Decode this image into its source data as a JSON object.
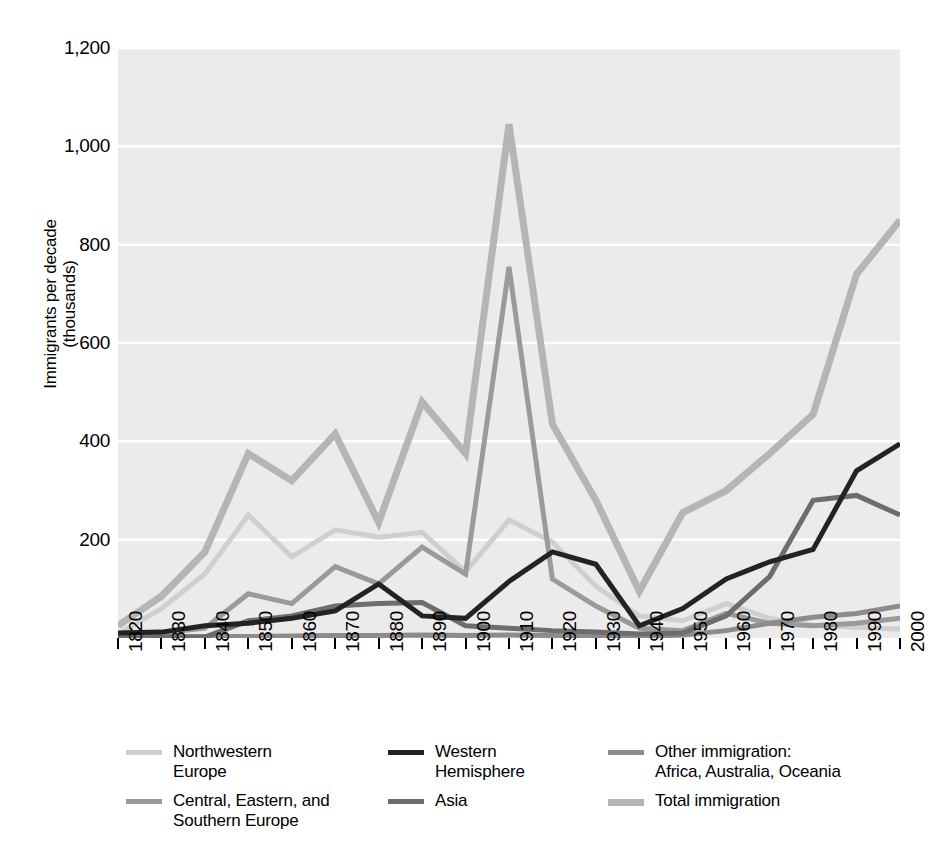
{
  "chart_data": {
    "type": "line",
    "title": "",
    "xlabel": "",
    "ylabel": "Immigrants per decade\n(thousands)",
    "ylabel_line1": "Immigrants per decade",
    "ylabel_line2": "(thousands)",
    "xlim": [
      1820,
      2000
    ],
    "ylim": [
      0,
      1200
    ],
    "grid": true,
    "grid_color": "#ffffff",
    "plot_background": "#ebebeb",
    "legend_position": "below",
    "x_tick_labels": [
      "1820",
      "1830",
      "1840",
      "1850",
      "1860",
      "1870",
      "1880",
      "1890",
      "1900",
      "1910",
      "1920",
      "1930",
      "1940",
      "1950",
      "1960",
      "1970",
      "1980",
      "1990",
      "2000"
    ],
    "y_tick_labels": [
      "1,200",
      "1,000",
      "800",
      "600",
      "400",
      "200"
    ],
    "y_tick_values": [
      1200,
      1000,
      800,
      600,
      400,
      200
    ],
    "x": [
      1820,
      1830,
      1840,
      1850,
      1860,
      1870,
      1880,
      1890,
      1900,
      1910,
      1920,
      1930,
      1940,
      1950,
      1960,
      1970,
      1980,
      1990,
      2000
    ],
    "series": [
      {
        "name": "Northwestern Europe",
        "label_line1": "Northwestern",
        "label_line2": "Europe",
        "color": "#cfcfcf",
        "width": 5,
        "values": [
          8,
          60,
          130,
          250,
          165,
          220,
          205,
          215,
          135,
          240,
          195,
          105,
          45,
          35,
          70,
          40,
          26,
          22,
          18
        ]
      },
      {
        "name": "Central, Eastern, and Southern Europe",
        "label_line1": "Central, Eastern, and",
        "label_line2": "Southern Europe",
        "color": "#9a9a9a",
        "width": 5,
        "values": [
          4,
          10,
          20,
          90,
          70,
          145,
          110,
          185,
          130,
          755,
          120,
          65,
          20,
          15,
          50,
          30,
          25,
          30,
          40
        ]
      },
      {
        "name": "Western Hemisphere",
        "label_line1": "Western",
        "label_line2": "Hemisphere",
        "color": "#232323",
        "width": 5,
        "values": [
          10,
          12,
          25,
          30,
          40,
          55,
          110,
          45,
          40,
          115,
          175,
          150,
          25,
          60,
          120,
          155,
          180,
          340,
          395
        ]
      },
      {
        "name": "Asia",
        "label_line1": "Asia",
        "label_line2": "",
        "color": "#6d6d6d",
        "width": 5,
        "values": [
          2,
          2,
          2,
          35,
          45,
          65,
          70,
          72,
          25,
          20,
          15,
          12,
          8,
          10,
          45,
          125,
          280,
          290,
          250
        ]
      },
      {
        "name": "Other immigration: Africa, Australia, Oceania",
        "label_line1": "Other immigration:",
        "label_line2": "Africa, Australia, Oceania",
        "color": "#8c8c8c",
        "width": 5,
        "values": [
          2,
          2,
          3,
          3,
          4,
          5,
          5,
          6,
          5,
          6,
          5,
          4,
          3,
          6,
          15,
          30,
          42,
          50,
          65
        ]
      },
      {
        "name": "Total immigration",
        "label_line1": "Total immigration",
        "label_line2": "",
        "color": "#b5b5b5",
        "width": 7,
        "values": [
          25,
          85,
          175,
          375,
          320,
          415,
          235,
          480,
          375,
          1045,
          435,
          280,
          95,
          255,
          300,
          375,
          455,
          740,
          850
        ]
      }
    ]
  },
  "legend": {
    "columns": [
      {
        "entries": [
          0,
          1
        ]
      },
      {
        "entries": [
          2,
          3
        ]
      },
      {
        "entries": [
          4,
          5
        ]
      }
    ]
  }
}
